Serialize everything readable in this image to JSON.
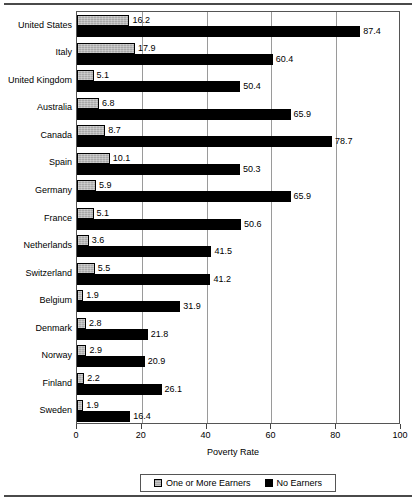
{
  "chart_data": {
    "type": "bar",
    "orientation": "horizontal",
    "title": "",
    "xlabel": "Poverty Rate",
    "ylabel": "",
    "xlim": [
      0,
      100
    ],
    "xticks": [
      0,
      20,
      40,
      60,
      80,
      100
    ],
    "grid": true,
    "legend_position": "bottom",
    "categories": [
      "United States",
      "Italy",
      "United Kingdom",
      "Australia",
      "Canada",
      "Spain",
      "Germany",
      "France",
      "Netherlands",
      "Switzerland",
      "Belgium",
      "Denmark",
      "Norway",
      "Finland",
      "Sweden"
    ],
    "series": [
      {
        "name": "One or More Earners",
        "color": "#a8a8a8",
        "values": [
          16.2,
          17.9,
          5.1,
          6.8,
          8.7,
          10.1,
          5.9,
          5.1,
          3.6,
          5.5,
          1.9,
          2.8,
          2.9,
          2.2,
          1.9
        ]
      },
      {
        "name": "No Earners",
        "color": "#000000",
        "values": [
          87.4,
          60.4,
          50.4,
          65.9,
          78.7,
          50.3,
          65.9,
          50.6,
          41.5,
          41.2,
          31.9,
          21.8,
          20.9,
          26.1,
          16.4
        ]
      }
    ]
  },
  "legend": {
    "items": [
      {
        "label": "One or More Earners",
        "swatch": "gray"
      },
      {
        "label": "No Earners",
        "swatch": "black"
      }
    ]
  }
}
